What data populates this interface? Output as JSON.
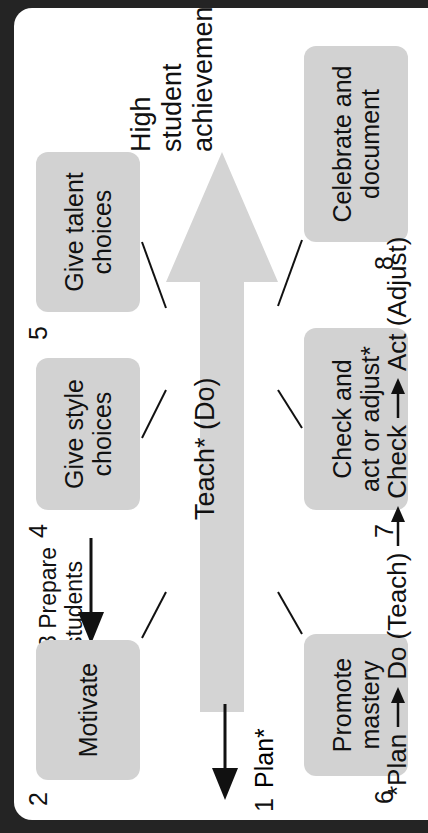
{
  "diagram": {
    "title": "High student achievement",
    "central_arrow_label": "Teach* (Do)",
    "achievement_label": "High student achievement",
    "steps": [
      {
        "number": "1",
        "label": "Plan*",
        "type": "inline-arrow"
      },
      {
        "number": "2",
        "label": "Motivate",
        "type": "box"
      },
      {
        "number": "3",
        "label": "Prepare students",
        "type": "inline-arrow"
      },
      {
        "number": "4",
        "label": "Give style choices",
        "type": "box"
      },
      {
        "number": "5",
        "label": "Give talent choices",
        "type": "box"
      },
      {
        "number": "6",
        "label": "Promote mastery",
        "type": "box"
      },
      {
        "number": "7",
        "label": "Check and act or adjust*",
        "type": "box"
      },
      {
        "number": "8",
        "label": "Celebrate and document",
        "type": "box"
      }
    ],
    "boxes": {
      "motivate": {
        "number": "2",
        "line1": "Motivate"
      },
      "give_style_choices": {
        "number": "4",
        "line1": "Give style",
        "line2": "choices"
      },
      "give_talent_choices": {
        "number": "5",
        "line1": "Give talent",
        "line2": "choices"
      },
      "promote_mastery": {
        "number": "6",
        "line1": "Promote",
        "line2": "mastery"
      },
      "check_and_act": {
        "number": "7",
        "line1": "Check and",
        "line2": "act or adjust*"
      },
      "celebrate_and_document": {
        "number": "8",
        "line1": "Celebrate and",
        "line2": "document"
      }
    },
    "prepare_students": {
      "number": "3",
      "text": "3 Prepare students"
    },
    "plan": {
      "number": "1",
      "label": "Plan*"
    },
    "achievement_lines": [
      "High",
      "student",
      "achievement"
    ],
    "footnote": {
      "full": "*Plan → Do (Teach) → Check → Act (Adjust)",
      "parts": [
        "*Plan",
        "Do (Teach)",
        "Check",
        "Act (Adjust)"
      ]
    },
    "colors": {
      "box_fill": "#d2d2d2",
      "arrow_fill": "#d4d4d4",
      "text": "#111111",
      "card_background": "#ffffff",
      "frame": "#242424"
    }
  }
}
